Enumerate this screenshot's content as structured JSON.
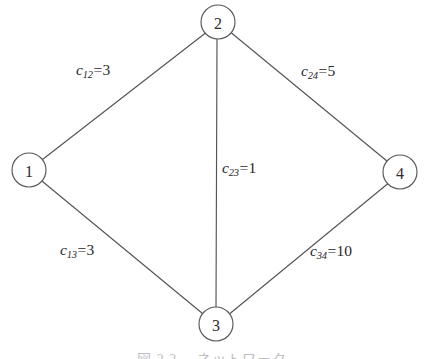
{
  "figure": {
    "background_color": "#ffffff",
    "stroke_color": "#53535a",
    "text_color": "#27272c",
    "caption": "図 2.2 　ネットワーク"
  },
  "graph_data": {
    "type": "node-link-diagram",
    "layout": "diamond",
    "nodes": [
      {
        "id": "1",
        "label": "1",
        "x": 29,
        "y": 170,
        "r": 17
      },
      {
        "id": "2",
        "label": "2",
        "x": 218,
        "y": 22,
        "r": 17
      },
      {
        "id": "3",
        "label": "3",
        "x": 216,
        "y": 324,
        "r": 17
      },
      {
        "id": "4",
        "label": "4",
        "x": 400,
        "y": 172,
        "r": 17
      }
    ],
    "edges": [
      {
        "id": "e12",
        "source": "1",
        "target": "2",
        "cost": 3,
        "var": "c",
        "sub": "12",
        "label_text": "c12=3",
        "label_x": 76,
        "label_y": 62
      },
      {
        "id": "e24",
        "source": "2",
        "target": "4",
        "cost": 5,
        "var": "c",
        "sub": "24",
        "label_text": "c24=5",
        "label_x": 301,
        "label_y": 63
      },
      {
        "id": "e23",
        "source": "2",
        "target": "3",
        "cost": 1,
        "var": "c",
        "sub": "23",
        "label_text": "c23=1",
        "label_x": 222,
        "label_y": 160
      },
      {
        "id": "e13",
        "source": "1",
        "target": "3",
        "cost": 3,
        "var": "c",
        "sub": "13",
        "label_text": "c13=3",
        "label_x": 60,
        "label_y": 242
      },
      {
        "id": "e34",
        "source": "3",
        "target": "4",
        "cost": 10,
        "var": "c",
        "sub": "34",
        "label_text": "c34=10",
        "label_x": 310,
        "label_y": 243
      }
    ]
  }
}
